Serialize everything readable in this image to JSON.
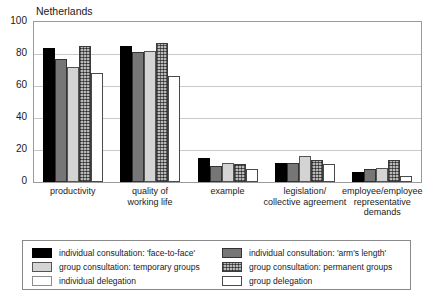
{
  "chart_data": {
    "type": "bar",
    "title": "Netherlands",
    "xlabel": "",
    "ylabel": "",
    "ylim": [
      0,
      100
    ],
    "yticks": [
      0,
      20,
      40,
      60,
      80,
      100
    ],
    "grid": true,
    "legend_position": "bottom",
    "categories": [
      "productivity",
      "quality of\nworking life",
      "example",
      "legislation/\ncollective agreement",
      "employee/employee\nrepresentative\ndemands"
    ],
    "category_lines": [
      [
        "productivity"
      ],
      [
        "quality of",
        "working life"
      ],
      [
        "example"
      ],
      [
        "legislation/",
        "collective agreement"
      ],
      [
        "employee/employee",
        "representative",
        "demands"
      ]
    ],
    "series": [
      {
        "name": "individual consultation: 'face-to-face'",
        "style": "s-black",
        "color": "#000000",
        "values": [
          84,
          85,
          15,
          12,
          6
        ]
      },
      {
        "name": "individual consultation: 'arm's length'",
        "style": "s-dgray",
        "color": "#767676",
        "values": [
          77,
          81,
          10,
          12,
          8
        ]
      },
      {
        "name": "group consultation: temporary groups",
        "style": "s-lgray",
        "color": "#d4d4d4",
        "values": [
          72,
          82,
          12,
          16,
          9
        ]
      },
      {
        "name": "group consultation: permanent groups",
        "style": "s-hatch",
        "color": "#b9b9b9",
        "values": [
          85,
          87,
          11,
          14,
          14
        ]
      },
      {
        "name": "individual delegation",
        "style": "s-white",
        "color": "#ffffff",
        "values": [
          68,
          66,
          8,
          11,
          4
        ]
      }
    ],
    "legend_entries": [
      {
        "label": "individual consultation: 'face-to-face'",
        "style": "s-black"
      },
      {
        "label": "group consultation: temporary groups",
        "style": "s-lgray"
      },
      {
        "label": "individual delegation",
        "style": "s-white-light"
      },
      {
        "label": "individual consultation: 'arm's length'",
        "style": "s-dgray"
      },
      {
        "label": "group consultation: permanent groups",
        "style": "s-hatch"
      },
      {
        "label": "group delegation",
        "style": "s-white"
      }
    ]
  }
}
